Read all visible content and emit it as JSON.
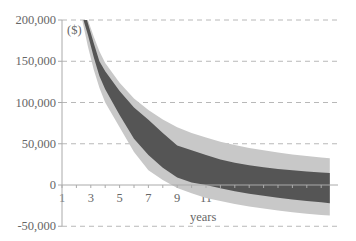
{
  "chart_data": {
    "type": "area",
    "title": "",
    "unit_label": "($)",
    "xlabel": "years",
    "ylabel": "($)",
    "x_ticks": [
      "1",
      "3",
      "5",
      "7",
      "9",
      "11",
      "13",
      "15",
      "17",
      "19"
    ],
    "y_ticks": [
      "200,000",
      "150,000",
      "100,000",
      "50,000",
      "0",
      "-50,000"
    ],
    "y_tick_values": [
      200000,
      150000,
      100000,
      50000,
      0,
      -50000
    ],
    "xlim": [
      1,
      19.6
    ],
    "ylim": [
      -50000,
      200000
    ],
    "grid": "horizontal dashed",
    "legend": "none",
    "x": [
      2.4,
      2.8,
      3.2,
      3.6,
      4,
      5,
      6,
      7,
      8,
      9,
      10,
      11,
      12,
      13,
      14,
      15,
      16,
      17,
      18,
      19,
      19.6
    ],
    "series": [
      {
        "name": "outer band (light)",
        "color": "#c8c8c8",
        "upper": [
          232000,
          200000,
          180000,
          162000,
          148000,
          124000,
          105000,
          91000,
          79500,
          70000,
          63000,
          57600,
          52500,
          48500,
          45000,
          42000,
          39300,
          37000,
          35000,
          33300,
          32500
        ],
        "lower": [
          200000,
          168000,
          140000,
          118000,
          100000,
          70000,
          40000,
          18000,
          6000,
          -3500,
          -10000,
          -15800,
          -19500,
          -23000,
          -26000,
          -28600,
          -31000,
          -33000,
          -34800,
          -36200,
          -37000
        ]
      },
      {
        "name": "inner band (dark)",
        "color": "#555555",
        "upper": [
          220000,
          196000,
          172000,
          150000,
          138000,
          114000,
          94000,
          79000,
          63000,
          48000,
          42000,
          36400,
          31000,
          27000,
          24000,
          21500,
          19500,
          17800,
          16200,
          15000,
          14500
        ],
        "lower": [
          205000,
          182000,
          155000,
          132000,
          116000,
          85000,
          56000,
          36400,
          21000,
          9000,
          3000,
          0,
          -4000,
          -7500,
          -10500,
          -13000,
          -15500,
          -17500,
          -19500,
          -21000,
          -22000
        ]
      }
    ]
  }
}
